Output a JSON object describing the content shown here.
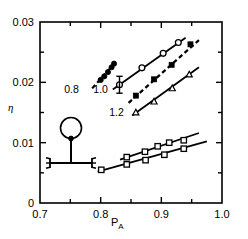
{
  "figure": {
    "ylabel": "η",
    "xlabel_main": "P",
    "xlabel_sub": "A",
    "inset_name": "molecular-schematic"
  },
  "chart_data": {
    "type": "scatter",
    "title": "",
    "xlabel": "P_A",
    "ylabel": "η",
    "xlim": [
      0.7,
      1.0
    ],
    "ylim": [
      0.0,
      0.03
    ],
    "grid": false,
    "legend": "inline-annotations",
    "xticks_major": [
      "0.7",
      "0.8",
      "0.9",
      "1.0"
    ],
    "xticks_major_values": [
      0.7,
      0.8,
      0.9,
      1.0
    ],
    "xticks_minor_values": [
      0.75,
      0.85,
      0.95
    ],
    "yticks_major": [
      "0",
      "0.01",
      "0.02",
      "0.03"
    ],
    "yticks_major_values": [
      0.0,
      0.01,
      0.02,
      0.03
    ],
    "yticks_minor_values": [
      0.005,
      0.015,
      0.025
    ],
    "annotations": [
      {
        "text": "0.8",
        "x": 0.752,
        "y": 0.0182
      },
      {
        "text": "1.0",
        "x": 0.8,
        "y": 0.0182
      },
      {
        "text": "1.2",
        "x": 0.826,
        "y": 0.0145
      }
    ],
    "series": [
      {
        "name": "0.8",
        "label": "0.8",
        "linestyle": "dashed",
        "marker": "filled-circle",
        "color": "#000000",
        "points": [
          {
            "x": 0.8,
            "y": 0.0204
          },
          {
            "x": 0.806,
            "y": 0.021
          },
          {
            "x": 0.812,
            "y": 0.0217
          },
          {
            "x": 0.818,
            "y": 0.0225
          },
          {
            "x": 0.822,
            "y": 0.0231
          }
        ],
        "fit_line": {
          "x0": 0.786,
          "y0": 0.019,
          "x1": 0.827,
          "y1": 0.0236
        }
      },
      {
        "name": "1.0",
        "label": "1.0",
        "linestyle": "solid",
        "marker": "open-circle",
        "color": "#000000",
        "errorbar": {
          "x": 0.831,
          "y": 0.0196,
          "yerr": 0.0014
        },
        "points": [
          {
            "x": 0.831,
            "y": 0.0196
          },
          {
            "x": 0.868,
            "y": 0.0224
          },
          {
            "x": 0.903,
            "y": 0.0248
          },
          {
            "x": 0.928,
            "y": 0.0266
          }
        ],
        "fit_line": {
          "x0": 0.82,
          "y0": 0.0188,
          "x1": 0.94,
          "y1": 0.0274
        }
      },
      {
        "name": "1.2",
        "label": "1.2",
        "linestyle": "dashed",
        "marker": "filled-square",
        "color": "#000000",
        "points": [
          {
            "x": 0.858,
            "y": 0.0178
          },
          {
            "x": 0.888,
            "y": 0.0205
          },
          {
            "x": 0.917,
            "y": 0.0229
          },
          {
            "x": 0.948,
            "y": 0.0263
          }
        ],
        "fit_line": {
          "x0": 0.846,
          "y0": 0.0166,
          "x1": 0.962,
          "y1": 0.027
        }
      },
      {
        "name": "series-4",
        "label": "",
        "linestyle": "solid",
        "marker": "open-triangle",
        "color": "#000000",
        "points": [
          {
            "x": 0.858,
            "y": 0.015
          },
          {
            "x": 0.888,
            "y": 0.0168
          },
          {
            "x": 0.918,
            "y": 0.019
          },
          {
            "x": 0.946,
            "y": 0.0213
          }
        ],
        "fit_line": {
          "x0": 0.852,
          "y0": 0.0145,
          "x1": 0.962,
          "y1": 0.0225
        }
      },
      {
        "name": "series-5",
        "label": "",
        "linestyle": "solid",
        "marker": "open-square",
        "color": "#000000",
        "points": [
          {
            "x": 0.843,
            "y": 0.0076
          },
          {
            "x": 0.873,
            "y": 0.0085
          },
          {
            "x": 0.894,
            "y": 0.0094
          },
          {
            "x": 0.913,
            "y": 0.01
          },
          {
            "x": 0.937,
            "y": 0.0104
          }
        ],
        "fit_line": {
          "x0": 0.832,
          "y0": 0.0072,
          "x1": 0.962,
          "y1": 0.0116
        }
      },
      {
        "name": "series-6",
        "label": "",
        "linestyle": "solid",
        "marker": "open-square",
        "color": "#000000",
        "points": [
          {
            "x": 0.801,
            "y": 0.0055
          },
          {
            "x": 0.843,
            "y": 0.0064
          },
          {
            "x": 0.874,
            "y": 0.0071
          },
          {
            "x": 0.905,
            "y": 0.008
          },
          {
            "x": 0.937,
            "y": 0.009
          }
        ],
        "fit_line": {
          "x0": 0.795,
          "y0": 0.0052,
          "x1": 0.975,
          "y1": 0.0102
        }
      }
    ]
  }
}
